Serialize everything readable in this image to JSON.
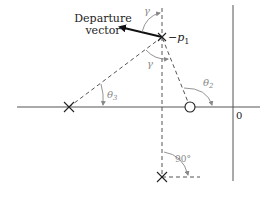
{
  "diagram": {
    "title_text": {
      "line1": "Departure",
      "line2": "vector"
    },
    "labels": {
      "pole_label_prefix": "−",
      "pole_label_var": "p",
      "pole_label_sub": "1",
      "gamma_top": "γ",
      "gamma_mid": "γ",
      "theta2_var": "θ",
      "theta2_sub": "2",
      "theta3_var": "θ",
      "theta3_sub": "3",
      "right_angle": "90°",
      "origin": "0"
    },
    "elements": {
      "poles": [
        {
          "name": "-p1",
          "x": 162,
          "y": 37
        },
        {
          "name": "left-real-pole",
          "x": 69,
          "y": 107
        },
        {
          "name": "conjugate-pole",
          "x": 162,
          "y": 177
        }
      ],
      "zeros": [
        {
          "name": "zero",
          "x": 190,
          "y": 107
        }
      ]
    },
    "colors": {
      "axis": "#555555",
      "line": "#333333",
      "angle_arc": "#888888",
      "label": "#222222",
      "label_gray": "#888888"
    }
  }
}
